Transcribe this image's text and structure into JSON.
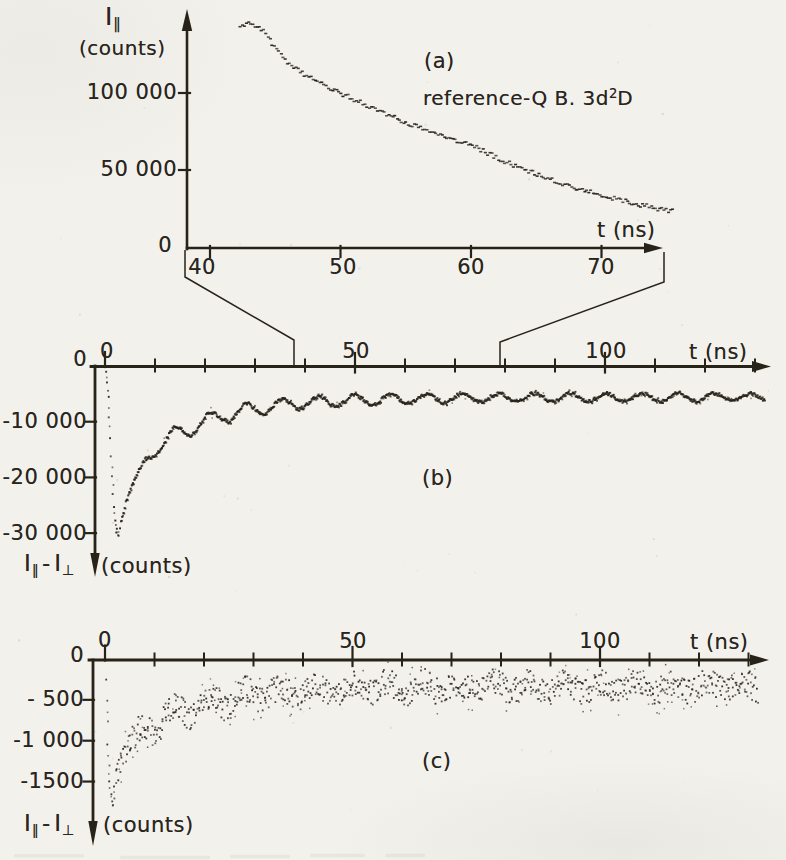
{
  "figure": {
    "paper_color": "#f2f1ec",
    "ink_color": "#272319"
  },
  "panel_a": {
    "label": "(a)",
    "annotation_prefix": "reference-Q B.  3d",
    "annotation_sup": "2",
    "annotation_suffix": "D",
    "y_title": {
      "symbol": "I",
      "sub": "∥",
      "units": "(counts)"
    },
    "x_axis_title": "t (ns)",
    "x_tick_labels": [
      "40",
      "50",
      "60",
      "70"
    ],
    "y_tick_labels": [
      "0",
      "50 000",
      "100 000"
    ]
  },
  "panel_b": {
    "label": "(b)",
    "y_title": {
      "symbol1": "I",
      "sub1": "∥",
      "sep": "-",
      "symbol2": "I",
      "sub2": "⊥",
      "units": "(counts)"
    },
    "x_axis_title": "t (ns)",
    "x_tick_labels": [
      "0",
      "50",
      "100"
    ],
    "y_tick_labels": [
      "0",
      "-10 000",
      "-20 000",
      "-30 000"
    ]
  },
  "panel_c": {
    "label": "(c)",
    "y_title": {
      "symbol1": "I",
      "sub1": "∥",
      "sep": "-",
      "symbol2": "I",
      "sub2": "⊥",
      "units": "(counts)"
    },
    "x_axis_title": "t (ns)",
    "x_tick_labels": [
      "0",
      "50",
      "100"
    ],
    "y_tick_labels": [
      "0",
      "- 500",
      "-1 000",
      "-1500"
    ]
  },
  "chart_data": [
    {
      "id": "a",
      "type": "scatter",
      "panel_label": "(a)",
      "title": "reference-Q B. 3d²D",
      "xlabel": "t (ns)",
      "ylabel": "I∥ (counts)",
      "xlim": [
        38.5,
        76.5
      ],
      "ylim": [
        0,
        155000
      ],
      "x_ticks": [
        40,
        50,
        60,
        70
      ],
      "y_ticks": [
        0,
        50000,
        100000
      ],
      "t_start": 42.3,
      "t_end": 75.6,
      "dot_step_ns": 0.165,
      "noise_counts": 1500,
      "series": [
        {
          "name": "parallel_intensity_decay",
          "sample_t": [
            42.3,
            43,
            44,
            46,
            48,
            50,
            52,
            54,
            56,
            58,
            60,
            62,
            64,
            66,
            68,
            70,
            72,
            74,
            75.6
          ],
          "sample_counts": [
            143000,
            146500,
            141000,
            118800,
            108000,
            100000,
            92000,
            84500,
            77500,
            71000,
            66500,
            58000,
            50600,
            44100,
            38500,
            33500,
            29300,
            25500,
            23000
          ]
        }
      ]
    },
    {
      "id": "b",
      "type": "scatter",
      "panel_label": "(b)",
      "xlabel": "t (ns)",
      "ylabel": "I∥ - I⊥ (counts)",
      "xlim": [
        0,
        133
      ],
      "ylim": [
        -33000,
        0
      ],
      "x_ticks_major": [
        0,
        50,
        100
      ],
      "x_ticks_minor": [
        10,
        20,
        30,
        40,
        60,
        70,
        80,
        90,
        110,
        120,
        130
      ],
      "y_ticks": [
        -10000,
        -20000,
        -30000
      ],
      "drop": {
        "t": [
          0.25,
          0.45,
          0.65,
          0.85,
          1.05,
          1.25,
          1.45,
          1.65,
          1.85,
          2.05,
          2.25,
          2.45,
          2.7,
          3.0
        ],
        "v": [
          -900,
          -3000,
          -5800,
          -9200,
          -12800,
          -16400,
          -19800,
          -22900,
          -25500,
          -27600,
          -29200,
          -30100,
          -30400,
          -28900
        ]
      },
      "mean_t": [
        3.2,
        4,
        5,
        6,
        8,
        10,
        12,
        14,
        16,
        18,
        20,
        24,
        28,
        32,
        36,
        40,
        45,
        50,
        60,
        70,
        80,
        90,
        100,
        110,
        120,
        130
      ],
      "mean_v": [
        -28157,
        -25004,
        -22086,
        -19939,
        -17003,
        -15048,
        -13599,
        -12442,
        -11480,
        -10667,
        -9973,
        -8861,
        -8038,
        -7426,
        -6971,
        -6632,
        -6328,
        -6118,
        -5872,
        -5756,
        -5700,
        -5674,
        -5661,
        -5655,
        -5652,
        -5651
      ],
      "oscillation": {
        "period_ns": 7.2,
        "first_max_ns": 21,
        "amp_base": 700,
        "amp_extra": 1300,
        "amp_tau": 30,
        "onset_ns": 6
      },
      "noise_counts": 280,
      "t_end": 132,
      "dot_step_ns": 0.24
    },
    {
      "id": "c",
      "type": "scatter",
      "panel_label": "(c)",
      "xlabel": "t (ns)",
      "ylabel": "I∥ - I⊥ (counts)",
      "xlim": [
        0,
        133
      ],
      "ylim": [
        -1900,
        0
      ],
      "x_ticks_major": [
        0,
        50,
        100
      ],
      "x_ticks_minor": [
        10,
        20,
        30,
        40,
        60,
        70,
        80,
        90,
        110,
        120,
        130
      ],
      "y_ticks": [
        -500,
        -1000,
        -1500
      ],
      "drop": {
        "t": [
          0.2,
          0.35,
          0.5,
          0.65,
          0.8,
          0.95,
          1.1,
          1.3,
          1.5,
          1.75,
          2.0
        ],
        "v": [
          -250,
          -500,
          -780,
          -1060,
          -1300,
          -1490,
          -1640,
          -1760,
          -1800,
          -1700,
          -1560
        ]
      },
      "mean_t": [
        2.2,
        3,
        4,
        5,
        6,
        8,
        10,
        12,
        14,
        16,
        18,
        20,
        25,
        30,
        35,
        40,
        45,
        50,
        60,
        70,
        80,
        90,
        100,
        110,
        120,
        130
      ],
      "mean_v": [
        -1500,
        -1309,
        -1152,
        -1047,
        -972,
        -863,
        -786,
        -721,
        -669,
        -626,
        -588,
        -555,
        -490,
        -445,
        -414,
        -392,
        -376,
        -365,
        -352,
        -346,
        -343,
        -341,
        -341,
        -340,
        -340,
        -340
      ],
      "oscillation": {
        "period_ns": 7.2,
        "first_max_ns": 21,
        "amp_base": 55,
        "amp_extra": 70,
        "amp_tau": 40,
        "onset_ns": 4
      },
      "noise_counts": 165,
      "t_end": 132,
      "dot_step_ns": 0.3
    }
  ]
}
